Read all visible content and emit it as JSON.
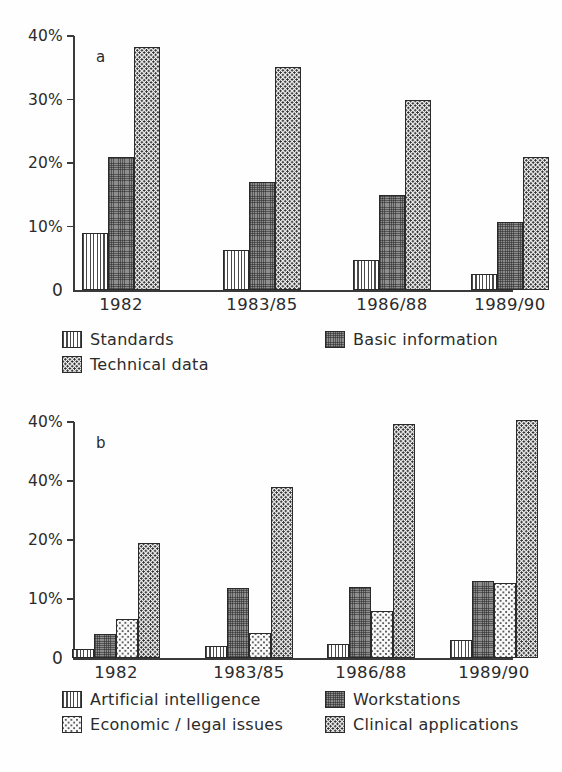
{
  "figure": {
    "panels": [
      "a",
      "b"
    ],
    "caption_fragment": ""
  },
  "chart_data": [
    {
      "type": "bar",
      "panel_letter": "a",
      "title": "",
      "xlabel": "",
      "ylabel": "",
      "categories": [
        "1982",
        "1983/85",
        "1986/88",
        "1989/90"
      ],
      "ylim": [
        0,
        40
      ],
      "ytick_values": [
        0,
        10,
        20,
        30,
        40
      ],
      "ytick_labels": [
        "0",
        "10%",
        "20%",
        "30%",
        "40%"
      ],
      "grid": false,
      "legend_position": "below-axes",
      "series": [
        {
          "name": "Standards",
          "pattern": "vertical-stripes",
          "values": [
            9.0,
            6.3,
            4.7,
            2.6
          ]
        },
        {
          "name": "Basic information",
          "pattern": "dark-crosshatch",
          "values": [
            21.0,
            17.0,
            15.0,
            10.7
          ]
        },
        {
          "name": "Technical data",
          "pattern": "dense-dots",
          "values": [
            38.2,
            35.1,
            29.9,
            20.9
          ]
        }
      ]
    },
    {
      "type": "bar",
      "panel_letter": "b",
      "title": "",
      "xlabel": "",
      "ylabel": "",
      "categories": [
        "1982",
        "1983/85",
        "1986/88",
        "1989/90"
      ],
      "ylim": [
        0,
        40
      ],
      "ytick_values": [
        0,
        10,
        20,
        30,
        40
      ],
      "ytick_labels": [
        "0",
        "10%",
        "20%",
        "40%",
        "40%"
      ],
      "grid": false,
      "legend_position": "below-axes",
      "series": [
        {
          "name": "Artificial intelligence",
          "pattern": "vertical-stripes",
          "values": [
            1.5,
            2.0,
            2.3,
            3.1
          ]
        },
        {
          "name": "Workstations",
          "pattern": "dark-crosshatch",
          "values": [
            4.0,
            11.9,
            12.1,
            13.0
          ]
        },
        {
          "name": "Economic / legal issues",
          "pattern": "light-dots",
          "values": [
            6.6,
            4.3,
            8.0,
            12.7
          ]
        },
        {
          "name": "Clinical applications",
          "pattern": "dense-dots",
          "values": [
            19.5,
            29.0,
            39.6,
            40.3
          ]
        }
      ]
    }
  ]
}
